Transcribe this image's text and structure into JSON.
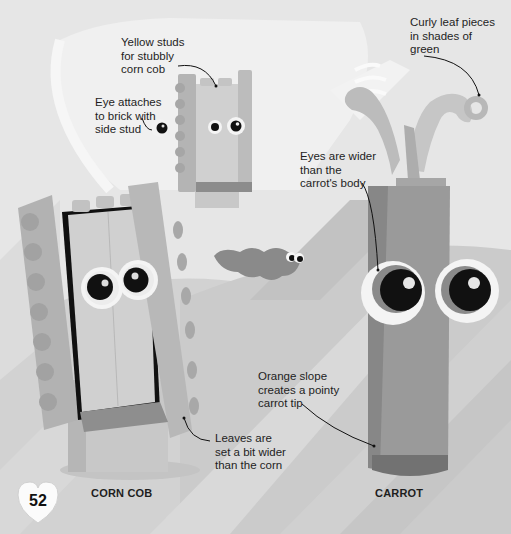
{
  "page": {
    "page_number": "52",
    "background_tone": "#e4e4e4"
  },
  "models": [
    {
      "id": "corn-cob",
      "caption": "CORN COB"
    },
    {
      "id": "carrot",
      "caption": "CARROT"
    }
  ],
  "annotations": [
    {
      "id": "yellow-studs",
      "text": "Yellow studs\nfor stubbly\ncorn cob"
    },
    {
      "id": "eye-attaches",
      "text": "Eye attaches\nto brick with\nside stud"
    },
    {
      "id": "curly-leaf",
      "text": "Curly leaf pieces\nin shades of\ngreen"
    },
    {
      "id": "eyes-wider",
      "text": "Eyes are wider\nthan the\ncarrot's body"
    },
    {
      "id": "orange-slope",
      "text": "Orange slope\ncreates a pointy\ncarrot tip"
    },
    {
      "id": "leaves-wider",
      "text": "Leaves are\nset a bit wider\nthan the corn"
    }
  ],
  "colors": {
    "light_band": "#d4d4d4",
    "mid_band": "#c4c4c4",
    "hill": "#cfcfcf",
    "brick_light": "#c9c9c9",
    "brick_mid": "#b0b0b0",
    "brick_dark": "#8e8e8e",
    "carrot_body": "#9a9a9a",
    "carrot_dark": "#7c7c7c",
    "leaf": "#bdbdbd",
    "eye_white": "#f6f6f6",
    "pupil": "#111111"
  }
}
